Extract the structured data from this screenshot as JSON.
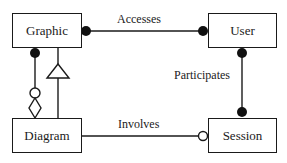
{
  "diagram": {
    "type": "entity-relationship",
    "entities": [
      {
        "id": "graphic",
        "label": "Graphic"
      },
      {
        "id": "user",
        "label": "User"
      },
      {
        "id": "diagram",
        "label": "Diagram"
      },
      {
        "id": "session",
        "label": "Session"
      }
    ],
    "relationships": [
      {
        "id": "accesses",
        "label": "Accesses",
        "from": "Graphic",
        "to": "User",
        "from_end": "filled-circle",
        "to_end": "filled-circle"
      },
      {
        "id": "participates",
        "label": "Participates",
        "from": "User",
        "to": "Session",
        "from_end": "filled-circle",
        "to_end": "filled-circle"
      },
      {
        "id": "involves",
        "label": "Involves",
        "from": "Diagram",
        "to": "Session",
        "from_end": "none",
        "to_end": "open-circle"
      },
      {
        "id": "aggregation",
        "label": "",
        "from": "Graphic",
        "to": "Diagram",
        "from_end": "filled-circle",
        "to_end": "open-circle-open-diamond"
      },
      {
        "id": "generalization",
        "label": "",
        "from": "Diagram",
        "to": "Graphic",
        "from_end": "none",
        "to_end": "open-triangle"
      }
    ]
  },
  "colors": {
    "stroke": "#1a1a1a",
    "background": "#ffffff"
  }
}
